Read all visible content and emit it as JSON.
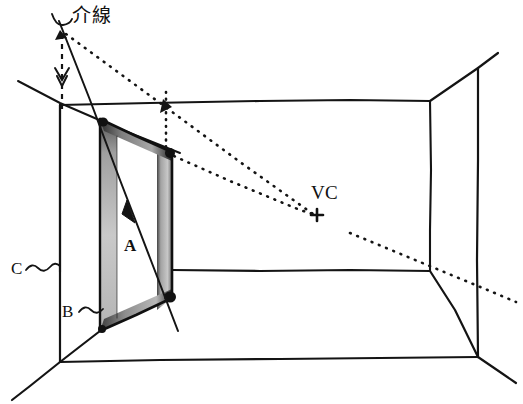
{
  "figure": {
    "type": "perspective-construction-diagram",
    "background_color": "#ffffff",
    "ink_color": "#111111",
    "shade_color_light": "#b9b9b9",
    "shade_color_dark": "#3a3a3a",
    "width": 523,
    "height": 404
  },
  "labels": {
    "measuring_line": "介線",
    "vanishing_center": "VC",
    "mark_a": "A",
    "mark_b": "B",
    "mark_c": "C",
    "tilde_b": "~",
    "tilde_c": "~"
  },
  "annotations": {
    "vc_cross_glyph": "+",
    "vc_cross_x": 317,
    "vc_cross_y": 215
  },
  "geometry": {
    "room": {
      "back_wall": {
        "top_left": [
          60,
          105
        ],
        "top_right": [
          430,
          100
        ],
        "bottom_right": [
          430,
          270
        ],
        "bottom_left": [
          60,
          272
        ]
      },
      "front_frame": {
        "top_left": [
          18,
          81
        ],
        "top_right": [
          478,
          68
        ],
        "bottom_right": [
          478,
          357
        ],
        "bottom_left": [
          60,
          362
        ]
      },
      "floor_front_edge": {
        "left": [
          60,
          362
        ],
        "right": [
          478,
          357
        ]
      }
    },
    "doorway": {
      "outer_top_left": [
        100,
        119
      ],
      "outer_bottom_left": [
        100,
        330
      ],
      "inner_top_right": [
        172,
        152
      ],
      "inner_bottom_right": [
        172,
        298
      ]
    },
    "measuring_line": {
      "start": [
        60,
        22
      ],
      "end": [
        178,
        330
      ]
    },
    "horizon_diagonal": {
      "start": [
        18,
        81
      ],
      "end": [
        180,
        152
      ]
    },
    "dashed_drop": {
      "from": [
        62,
        32
      ],
      "to": [
        62,
        113
      ]
    },
    "dotted_drop": {
      "from": [
        166,
        95
      ],
      "to": [
        166,
        152
      ]
    },
    "dotted_ray_upper": {
      "from": [
        64,
        33
      ],
      "to": [
        315,
        216
      ]
    },
    "dotted_ray_lower": {
      "from": [
        166,
        152
      ],
      "to": [
        315,
        216
      ]
    }
  }
}
